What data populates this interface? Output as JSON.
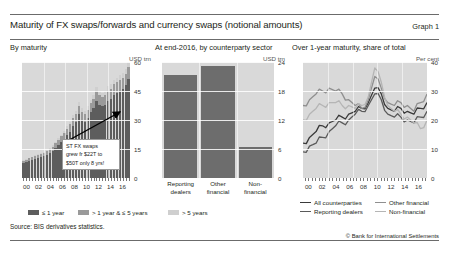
{
  "header": {
    "title": "Maturity of FX swaps/forwards and currency swaps (notional amounts)",
    "graph_number": "Graph 1"
  },
  "panels": {
    "left": {
      "heading": "By maturity",
      "unit": "USD trn"
    },
    "middle": {
      "heading": "At end-2016, by counterparty sector",
      "unit": "USD trn"
    },
    "right": {
      "heading": "Over 1-year maturity, share of total",
      "unit": "Per cent"
    }
  },
  "annotation": {
    "line1": "ST FX swaps",
    "line2": "grew fr $22T to",
    "line3": "$50T only 8 yrs!"
  },
  "legend": {
    "le1year": "≤ 1 year",
    "gt1le5": "> 1 year & ≤ 5 years",
    "gt5": "> 5 years",
    "all_counterparties": "All counterparties",
    "other_financial": "Other financial",
    "reporting_dealers": "Reporting dealers",
    "non_financial": "Non-financial"
  },
  "footer": {
    "source": "Source: BIS derivatives statistics.",
    "copyright": "© Bank for International Settlements"
  },
  "colors": {
    "le1year": "#5d5d5d",
    "gt1le5": "#9a9a9a",
    "gt5": "#cfcfcf",
    "bar_fill": "#6d6d6d",
    "plot_bg": "#d9d9d9",
    "all_counterparties": "#3a3a3a",
    "other_financial": "#8f8f8f",
    "reporting_dealers": "#5a5a5a",
    "non_financial": "#b5b5b5"
  },
  "chart_data": [
    {
      "type": "bar",
      "id": "by-maturity",
      "title": "By maturity",
      "ylabel": "USD trn",
      "ylim": [
        0,
        60
      ],
      "yticks": [
        0,
        15,
        30,
        45,
        60
      ],
      "xlabel": "",
      "xticks": [
        "00",
        "02",
        "04",
        "06",
        "08",
        "10",
        "12",
        "14",
        "16"
      ],
      "grid": true,
      "stacked": true,
      "x": [
        "1998H2",
        "1999H1",
        "1999H2",
        "2000H1",
        "2000H2",
        "2001H1",
        "2001H2",
        "2002H1",
        "2002H2",
        "2003H1",
        "2003H2",
        "2004H1",
        "2004H2",
        "2005H1",
        "2005H2",
        "2006H1",
        "2006H2",
        "2007H1",
        "2007H2",
        "2008H1",
        "2008H2",
        "2009H1",
        "2009H2",
        "2010H1",
        "2010H2",
        "2011H1",
        "2011H2",
        "2012H1",
        "2012H2",
        "2013H1",
        "2013H2",
        "2014H1",
        "2014H2",
        "2015H1",
        "2015H2",
        "2016H1",
        "2016H2"
      ],
      "series": [
        {
          "name": "≤ 1 year",
          "color": "#5d5d5d",
          "values": [
            8,
            8.5,
            9,
            9.5,
            10,
            10.5,
            11,
            11.5,
            12,
            13,
            14,
            15.5,
            17,
            18.5,
            20,
            22,
            24,
            27,
            29,
            33,
            30,
            29,
            31,
            34,
            36,
            40,
            38,
            37,
            38,
            40,
            41,
            43,
            44,
            45,
            46,
            48,
            53
          ]
        },
        {
          "name": "> 1 year & ≤ 5 years",
          "color": "#9a9a9a",
          "values": [
            1,
            1,
            1.1,
            1.2,
            1.3,
            1.4,
            1.5,
            1.6,
            1.8,
            2,
            2.2,
            2.5,
            2.8,
            3,
            3.2,
            3.5,
            3.8,
            4,
            4.2,
            4.5,
            4.3,
            4.2,
            4.4,
            4.6,
            4.8,
            5,
            5,
            4.9,
            5,
            5.2,
            5.3,
            5.5,
            5.6,
            5.7,
            5.8,
            6,
            6.2
          ]
        },
        {
          "name": "> 5 years",
          "color": "#cfcfcf",
          "values": [
            0.3,
            0.3,
            0.3,
            0.4,
            0.4,
            0.4,
            0.5,
            0.5,
            0.6,
            0.6,
            0.7,
            0.8,
            0.9,
            1,
            1.1,
            1.2,
            1.3,
            1.5,
            1.6,
            1.8,
            1.7,
            1.7,
            1.8,
            1.9,
            2,
            2.1,
            2.1,
            2.1,
            2.1,
            2.2,
            2.2,
            2.3,
            2.3,
            2.4,
            2.4,
            2.5,
            2.6
          ]
        }
      ],
      "annotation_text": "ST FX swaps grew fr $22T to $50T only 8 yrs!"
    },
    {
      "type": "bar",
      "id": "by-counterparty-sector",
      "title": "At end-2016, by counterparty sector",
      "ylabel": "USD trn",
      "ylim": [
        0,
        24
      ],
      "yticks": [
        0,
        6,
        12,
        18,
        24
      ],
      "grid": true,
      "categories": [
        "Reporting dealers",
        "Other financial",
        "Non-financial"
      ],
      "categories_wrapped": [
        [
          "Reporting",
          "dealers"
        ],
        [
          "Other",
          "financial"
        ],
        [
          "Non-",
          "financial"
        ]
      ],
      "values": [
        21.3,
        23.2,
        6.5
      ],
      "color": "#6d6d6d"
    },
    {
      "type": "line",
      "id": "over-1-year-share",
      "title": "Over 1-year maturity, share of total",
      "ylabel": "Per cent",
      "ylim": [
        0,
        40
      ],
      "yticks": [
        0,
        10,
        20,
        30,
        40
      ],
      "xticks": [
        "00",
        "02",
        "04",
        "06",
        "08",
        "10",
        "12",
        "14",
        "16"
      ],
      "grid": true,
      "legend_position": "below",
      "x": [
        "1998",
        "1999",
        "2000",
        "2001",
        "2002",
        "2003",
        "2004",
        "2005",
        "2006",
        "2007",
        "2008",
        "2009",
        "2010",
        "2011",
        "2012",
        "2013",
        "2014",
        "2015",
        "2016",
        "2017"
      ],
      "series": [
        {
          "name": "All counterparties",
          "color": "#3a3a3a",
          "values": [
            12,
            14,
            16,
            18,
            19,
            20,
            21,
            22,
            23,
            24,
            26,
            31,
            29,
            24,
            23,
            24,
            23,
            22,
            24,
            26
          ]
        },
        {
          "name": "Reporting dealers",
          "color": "#5a5a5a",
          "values": [
            9,
            11,
            12,
            14,
            16,
            18,
            19,
            20,
            22,
            23,
            25,
            29,
            27,
            22,
            21,
            21,
            20,
            19,
            21,
            23
          ]
        },
        {
          "name": "Other financial",
          "color": "#8f8f8f",
          "values": [
            25,
            27,
            29,
            30,
            31,
            30,
            29,
            27,
            25,
            24,
            27,
            35,
            31,
            26,
            25,
            26,
            25,
            23,
            26,
            29
          ]
        },
        {
          "name": "Non-financial",
          "color": "#b5b5b5",
          "values": [
            20,
            22,
            24,
            25,
            26,
            26,
            25,
            25,
            24,
            25,
            28,
            38,
            33,
            25,
            23,
            22,
            21,
            19,
            17,
            20
          ]
        }
      ]
    }
  ]
}
